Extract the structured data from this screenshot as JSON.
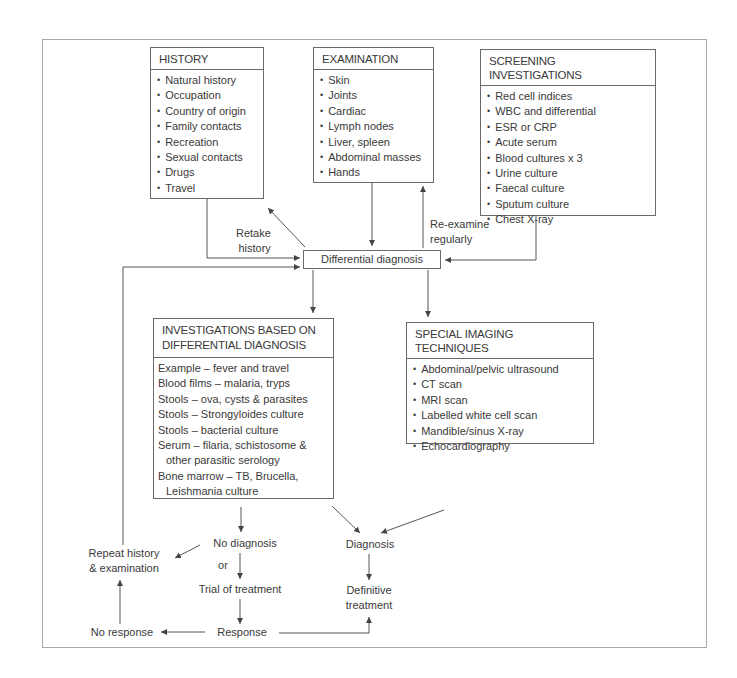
{
  "history": {
    "title": "HISTORY",
    "items": [
      "Natural history",
      "Occupation",
      "Country of origin",
      "Family contacts",
      "Recreation",
      "Sexual contacts",
      "Drugs",
      "Travel"
    ]
  },
  "examination": {
    "title": "EXAMINATION",
    "items": [
      "Skin",
      "Joints",
      "Cardiac",
      "Lymph nodes",
      "Liver, spleen",
      "Abdominal masses",
      "Hands"
    ]
  },
  "screening": {
    "title": "SCREENING INVESTIGATIONS",
    "items": [
      "Red cell indices",
      "WBC and differential",
      "ESR or CRP",
      "Acute serum",
      "Blood cultures x 3",
      "Urine culture",
      "Faecal culture",
      "Sputum culture",
      "Chest X-ray"
    ]
  },
  "differential": {
    "label": "Differential diagnosis"
  },
  "edge_labels": {
    "retake_1": "Retake",
    "retake_2": "history",
    "reexamine_1": "Re-examine",
    "reexamine_2": "regularly"
  },
  "investigations": {
    "title_1": "INVESTIGATIONS BASED ON",
    "title_2": "DIFFERENTIAL DIAGNOSIS",
    "items": [
      "Example – fever and travel",
      "Blood films – malaria, tryps",
      "Stools – ova, cysts & parasites",
      "Stools – Strongyloides culture",
      "Stools – bacterial culture",
      "Serum – filaria, schistosome &",
      "other parasitic serology",
      "Bone marrow – TB, Brucella,",
      "Leishmania culture"
    ]
  },
  "imaging": {
    "title": "SPECIAL IMAGING TECHNIQUES",
    "items": [
      "Abdominal/pelvic ultrasound",
      "CT scan",
      "MRI scan",
      "Labelled white cell scan",
      "Mandible/sinus X-ray",
      "Echocardiography"
    ]
  },
  "outcomes": {
    "repeat_1": "Repeat history",
    "repeat_2": "& examination",
    "no_diagnosis": "No diagnosis",
    "or": "or",
    "trial": "Trial of treatment",
    "no_response": "No response",
    "response": "Response",
    "diagnosis": "Diagnosis",
    "definitive_1": "Definitive",
    "definitive_2": "treatment"
  },
  "colors": {
    "line": "#555555",
    "frame": "#a9a9a9",
    "text": "#3a3a3a"
  }
}
